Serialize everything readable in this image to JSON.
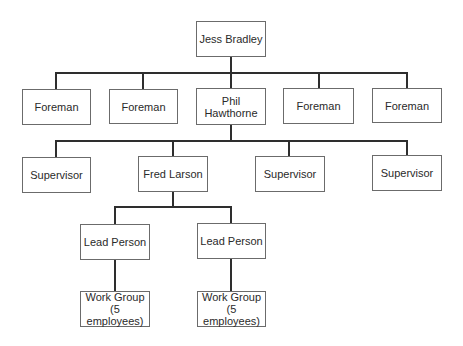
{
  "diagram": {
    "type": "org-chart",
    "nodes": {
      "jess": "Jess Bradley",
      "foreman1": "Foreman",
      "foreman2": "Foreman",
      "phil": "Phil\nHawthorne",
      "foreman4": "Foreman",
      "foreman5": "Foreman",
      "supervisor1": "Supervisor",
      "fred": "Fred Larson",
      "supervisor3": "Supervisor",
      "supervisor4": "Supervisor",
      "lead1": "Lead Person",
      "lead2": "Lead Person",
      "workgroup1": "Work Group\n(5 employees)",
      "workgroup2": "Work Group\n(5 employees)"
    },
    "edges": [
      [
        "Jess Bradley",
        "Foreman"
      ],
      [
        "Jess Bradley",
        "Foreman"
      ],
      [
        "Jess Bradley",
        "Phil Hawthorne"
      ],
      [
        "Jess Bradley",
        "Foreman"
      ],
      [
        "Jess Bradley",
        "Foreman"
      ],
      [
        "Phil Hawthorne",
        "Supervisor"
      ],
      [
        "Phil Hawthorne",
        "Fred Larson"
      ],
      [
        "Phil Hawthorne",
        "Supervisor"
      ],
      [
        "Phil Hawthorne",
        "Supervisor"
      ],
      [
        "Fred Larson",
        "Lead Person"
      ],
      [
        "Fred Larson",
        "Lead Person"
      ],
      [
        "Lead Person",
        "Work Group (5 employees)"
      ],
      [
        "Lead Person",
        "Work Group (5 employees)"
      ]
    ],
    "colors": {
      "line": "#2e2e2e",
      "border": "#6b6b6b",
      "text": "#2a2a2a",
      "background": "#ffffff"
    }
  }
}
